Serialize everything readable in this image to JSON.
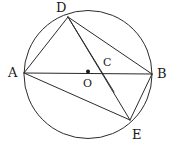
{
  "figure": {
    "type": "geometry-diagram",
    "width": 177,
    "height": 154,
    "background_color": "#ffffff",
    "stroke_color": "#2b2b2b",
    "label_color": "#1a1a1a"
  },
  "circle": {
    "name": "main-circle",
    "center_x": 88,
    "center_y": 74.5,
    "radius": 64,
    "stroke_width": 1
  },
  "center_dot": {
    "name": "center-point-O",
    "x": 88,
    "y": 71.5,
    "radius": 2
  },
  "points": [
    {
      "id": "A",
      "label": "A",
      "x": 24,
      "y": 73,
      "label_x": 8,
      "label_y": 66
    },
    {
      "id": "B",
      "label": "B",
      "x": 152,
      "y": 74,
      "label_x": 157,
      "label_y": 67
    },
    {
      "id": "D",
      "label": "D",
      "x": 68,
      "y": 17,
      "label_x": 56,
      "label_y": 1
    },
    {
      "id": "E",
      "label": "E",
      "x": 130,
      "y": 120,
      "label_x": 132,
      "label_y": 128
    },
    {
      "id": "O",
      "label": "O",
      "x": 88,
      "y": 71.5,
      "label_x": 83,
      "label_y": 78
    },
    {
      "id": "C",
      "label": "C",
      "x": 103,
      "y": 73,
      "label_x": 103,
      "label_y": 57
    }
  ],
  "segments": [
    {
      "name": "segment-AB",
      "from": "A",
      "to": "B",
      "x1": 24,
      "y1": 73,
      "x2": 152,
      "y2": 74
    },
    {
      "name": "segment-AD",
      "from": "A",
      "to": "D",
      "x1": 24,
      "y1": 73,
      "x2": 68,
      "y2": 17
    },
    {
      "name": "segment-AE",
      "from": "A",
      "to": "E",
      "x1": 24,
      "y1": 73,
      "x2": 130,
      "y2": 120
    },
    {
      "name": "segment-DB",
      "from": "D",
      "to": "B",
      "x1": 68,
      "y1": 17,
      "x2": 152,
      "y2": 74
    },
    {
      "name": "segment-DE",
      "from": "D",
      "to": "E",
      "x1": 68,
      "y1": 17,
      "x2": 130,
      "y2": 120
    },
    {
      "name": "segment-DO",
      "from": "D",
      "to": "O",
      "x1": 68,
      "y1": 17,
      "x2": 114,
      "y2": 92
    },
    {
      "name": "segment-BE",
      "from": "B",
      "to": "E",
      "x1": 152,
      "y1": 74,
      "x2": 130,
      "y2": 120
    }
  ]
}
